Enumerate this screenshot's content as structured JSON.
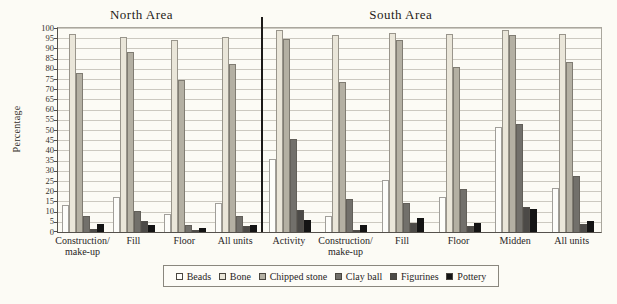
{
  "figure_title_left": "North Area",
  "figure_title_right": "South Area",
  "chart_data": {
    "type": "bar",
    "ylabel": "Percentage",
    "ylim": [
      0,
      100
    ],
    "ytick_step": 5,
    "grid": true,
    "legend_position": "bottom",
    "series_names": [
      "Beads",
      "Bone",
      "Chipped stone",
      "Clay ball",
      "Figurines",
      "Pottery"
    ],
    "series_colors": {
      "Beads": "#fdfdfa",
      "Bone": "#eae6d9",
      "Chipped stone": "#b4b0a3",
      "Clay ball": "#72706b",
      "Figurines": "#4c4a47",
      "Pottery": "#141414"
    },
    "hatched_series": [
      "Bone",
      "Chipped stone"
    ],
    "panels": [
      {
        "title": "North Area",
        "categories": [
          "Construction/\nmake-up",
          "Fill",
          "Floor",
          "All units"
        ],
        "series": [
          {
            "name": "Beads",
            "values": [
              13,
              17,
              9,
              14
            ]
          },
          {
            "name": "Bone",
            "values": [
              97,
              95.5,
              94,
              95.5
            ]
          },
          {
            "name": "Chipped stone",
            "values": [
              78,
              88,
              74.5,
              82.5
            ]
          },
          {
            "name": "Clay ball",
            "values": [
              8,
              10.5,
              3.5,
              8
            ]
          },
          {
            "name": "Figurines",
            "values": [
              1.5,
              5.5,
              1,
              3
            ]
          },
          {
            "name": "Pottery",
            "values": [
              4,
              3.5,
              2,
              3.5
            ]
          }
        ]
      },
      {
        "title": "South Area",
        "categories": [
          "Activity",
          "Construction/\nmake-up",
          "Fill",
          "Floor",
          "Midden",
          "All units"
        ],
        "series": [
          {
            "name": "Beads",
            "values": [
              36,
              8,
              25.5,
              17,
              51.5,
              21.5
            ]
          },
          {
            "name": "Bone",
            "values": [
              99,
              96.5,
              97.5,
              97,
              99,
              97
            ]
          },
          {
            "name": "Chipped stone",
            "values": [
              94.5,
              73.5,
              94,
              81,
              96.5,
              83.5
            ]
          },
          {
            "name": "Clay ball",
            "values": [
              45.5,
              16,
              14,
              21,
              53,
              27.5
            ]
          },
          {
            "name": "Figurines",
            "values": [
              11,
              1,
              4.5,
              3,
              12.5,
              4
            ]
          },
          {
            "name": "Pottery",
            "values": [
              6,
              3.5,
              7,
              4.5,
              11.5,
              5.5
            ]
          }
        ]
      }
    ]
  }
}
